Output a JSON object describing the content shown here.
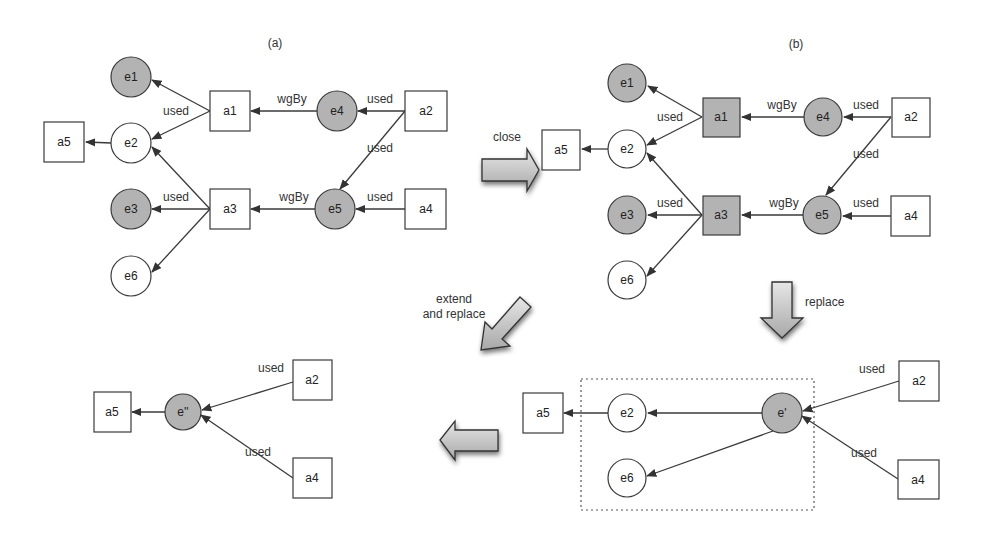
{
  "panels": {
    "a": {
      "title": "(a)",
      "nodes": [
        {
          "id": "e1",
          "label": "e1",
          "type": "entity",
          "filled": true,
          "x": 131,
          "y": 77
        },
        {
          "id": "e2",
          "label": "e2",
          "type": "entity",
          "filled": false,
          "x": 131,
          "y": 143
        },
        {
          "id": "e3",
          "label": "e3",
          "type": "entity",
          "filled": true,
          "x": 131,
          "y": 209
        },
        {
          "id": "e6",
          "label": "e6",
          "type": "entity",
          "filled": false,
          "x": 131,
          "y": 276
        },
        {
          "id": "e4",
          "label": "e4",
          "type": "entity",
          "filled": true,
          "x": 337,
          "y": 111
        },
        {
          "id": "e5",
          "label": "e5",
          "type": "entity",
          "filled": true,
          "x": 335,
          "y": 209
        },
        {
          "id": "a1",
          "label": "a1",
          "type": "activity",
          "filled": false,
          "x": 230,
          "y": 111
        },
        {
          "id": "a3",
          "label": "a3",
          "type": "activity",
          "filled": false,
          "x": 230,
          "y": 209
        },
        {
          "id": "a2",
          "label": "a2",
          "type": "activity",
          "filled": false,
          "x": 426,
          "y": 111
        },
        {
          "id": "a4",
          "label": "a4",
          "type": "activity",
          "filled": false,
          "x": 426,
          "y": 209
        },
        {
          "id": "a5",
          "label": "a5",
          "type": "activity",
          "filled": false,
          "x": 64,
          "y": 142
        }
      ],
      "edge_labels": [
        {
          "text": "used",
          "x": 176,
          "y": 115
        },
        {
          "text": "wgBy",
          "x": 292,
          "y": 103
        },
        {
          "text": "used",
          "x": 380,
          "y": 103
        },
        {
          "text": "used",
          "x": 380,
          "y": 152
        },
        {
          "text": "used",
          "x": 176,
          "y": 201
        },
        {
          "text": "wgBy",
          "x": 294,
          "y": 201
        },
        {
          "text": "used",
          "x": 380,
          "y": 201
        }
      ]
    },
    "b": {
      "title": "(b)",
      "nodes": [
        {
          "id": "e1",
          "label": "e1",
          "type": "entity",
          "filled": true,
          "x": 627,
          "y": 83
        },
        {
          "id": "e2",
          "label": "e2",
          "type": "entity",
          "filled": false,
          "x": 627,
          "y": 149
        },
        {
          "id": "e3",
          "label": "e3",
          "type": "entity",
          "filled": true,
          "x": 627,
          "y": 215
        },
        {
          "id": "e6",
          "label": "e6",
          "type": "entity",
          "filled": false,
          "x": 627,
          "y": 280
        },
        {
          "id": "e4",
          "label": "e4",
          "type": "entity",
          "filled": true,
          "x": 823,
          "y": 117
        },
        {
          "id": "e5",
          "label": "e5",
          "type": "entity",
          "filled": true,
          "x": 822,
          "y": 215
        },
        {
          "id": "a1",
          "label": "a1",
          "type": "activity",
          "filled": true,
          "x": 721,
          "y": 117
        },
        {
          "id": "a3",
          "label": "a3",
          "type": "activity",
          "filled": true,
          "x": 721,
          "y": 215
        },
        {
          "id": "a2",
          "label": "a2",
          "type": "activity",
          "filled": false,
          "x": 911,
          "y": 117
        },
        {
          "id": "a4",
          "label": "a4",
          "type": "activity",
          "filled": false,
          "x": 911,
          "y": 216
        },
        {
          "id": "a5",
          "label": "a5",
          "type": "activity",
          "filled": false,
          "x": 561,
          "y": 150
        }
      ],
      "edge_labels": [
        {
          "text": "used",
          "x": 670,
          "y": 121
        },
        {
          "text": "wgBy",
          "x": 782,
          "y": 109
        },
        {
          "text": "used",
          "x": 866,
          "y": 109
        },
        {
          "text": "used",
          "x": 866,
          "y": 158
        },
        {
          "text": "used",
          "x": 670,
          "y": 207
        },
        {
          "text": "wgBy",
          "x": 784,
          "y": 207
        },
        {
          "text": "used",
          "x": 866,
          "y": 207
        }
      ]
    },
    "c": {
      "nodes": [
        {
          "id": "a5",
          "label": "a5",
          "type": "activity",
          "filled": false,
          "x": 112,
          "y": 412
        },
        {
          "id": "e''",
          "label": "e''",
          "type": "entity",
          "filled": true,
          "x": 183,
          "y": 412
        },
        {
          "id": "a2",
          "label": "a2",
          "type": "activity",
          "filled": false,
          "x": 312,
          "y": 380
        },
        {
          "id": "a4",
          "label": "a4",
          "type": "activity",
          "filled": false,
          "x": 312,
          "y": 478
        }
      ],
      "edge_labels": [
        {
          "text": "used",
          "x": 271,
          "y": 372
        },
        {
          "text": "used",
          "x": 258,
          "y": 456
        }
      ]
    },
    "d": {
      "nodes": [
        {
          "id": "a5",
          "label": "a5",
          "type": "activity",
          "filled": false,
          "x": 543,
          "y": 413
        },
        {
          "id": "e2",
          "label": "e2",
          "type": "entity",
          "filled": false,
          "x": 627,
          "y": 413
        },
        {
          "id": "e6",
          "label": "e6",
          "type": "entity",
          "filled": false,
          "x": 627,
          "y": 478
        },
        {
          "id": "e'",
          "label": "e'",
          "type": "entity",
          "filled": true,
          "x": 782,
          "y": 413
        },
        {
          "id": "a2",
          "label": "a2",
          "type": "activity",
          "filled": false,
          "x": 919,
          "y": 381
        },
        {
          "id": "a4",
          "label": "a4",
          "type": "activity",
          "filled": false,
          "x": 918,
          "y": 480
        }
      ],
      "edge_labels": [
        {
          "text": "used",
          "x": 872,
          "y": 373
        },
        {
          "text": "used",
          "x": 864,
          "y": 457
        }
      ]
    }
  },
  "transitions": {
    "close": "close",
    "replace": "replace",
    "extend_line1": "extend",
    "extend_line2": "and replace"
  },
  "colors": {
    "filled_node": "#b3b3b3",
    "stroke": "#3a3a3a",
    "background": "#ffffff"
  }
}
